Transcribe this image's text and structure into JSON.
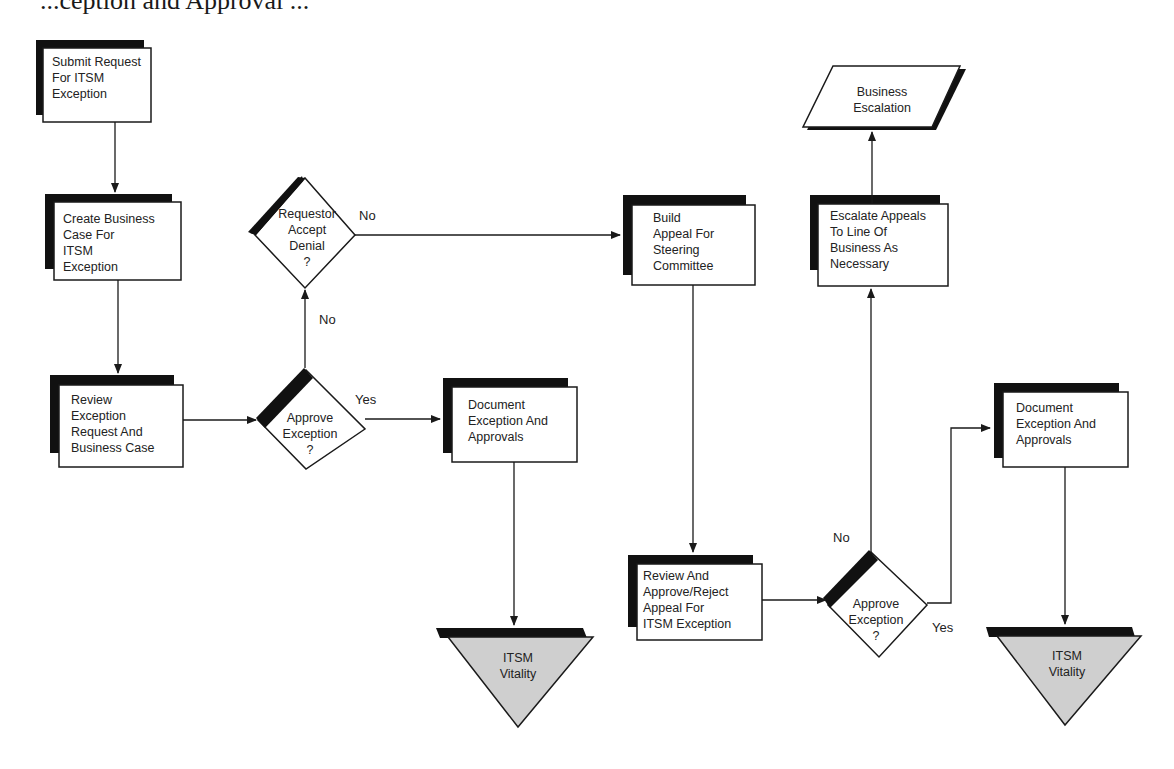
{
  "header": {
    "cut_text": "    ...ception and Approval ..."
  },
  "colors": {
    "stroke": "#1a1a1a",
    "shadow": "#111111",
    "box_fill": "#ffffff",
    "terminal_fill": "#cfcfcf"
  },
  "nodes": {
    "submit_request": {
      "type": "process",
      "lines": [
        "Submit Request",
        "For ITSM",
        "Exception"
      ]
    },
    "create_business_case": {
      "type": "process",
      "lines": [
        "Create Business",
        "Case For",
        "ITSM",
        "Exception"
      ]
    },
    "review_exception_request": {
      "type": "process",
      "lines": [
        "Review",
        "Exception",
        "Request And",
        "Business Case"
      ]
    },
    "approve_exception_1": {
      "type": "decision",
      "lines": [
        "Approve",
        "Exception",
        "?"
      ]
    },
    "requestor_accept_denial": {
      "type": "decision",
      "lines": [
        "Requestor",
        "Accept",
        "Denial",
        "?"
      ]
    },
    "document_exception_1": {
      "type": "process",
      "lines": [
        "Document",
        "Exception And",
        "Approvals"
      ]
    },
    "itsm_vitality_1": {
      "type": "terminal-triangle",
      "lines": [
        "ITSM",
        "Vitality"
      ]
    },
    "build_appeal": {
      "type": "process",
      "lines": [
        "Build",
        "Appeal For",
        "Steering",
        "Committee"
      ]
    },
    "review_approve_reject_appeal": {
      "type": "process",
      "lines": [
        "Review And",
        "Approve/Reject",
        "Appeal For",
        "ITSM Exception"
      ]
    },
    "approve_exception_2": {
      "type": "decision",
      "lines": [
        "Approve",
        "Exception",
        "?"
      ]
    },
    "escalate_appeals": {
      "type": "process",
      "lines": [
        "Escalate Appeals",
        "To Line Of",
        "Business As",
        "Necessary"
      ]
    },
    "business_escalation": {
      "type": "data-parallelogram",
      "lines": [
        "Business",
        "Escalation"
      ]
    },
    "document_exception_2": {
      "type": "process",
      "lines": [
        "Document",
        "Exception And",
        "Approvals"
      ]
    },
    "itsm_vitality_2": {
      "type": "terminal-triangle",
      "lines": [
        "ITSM",
        "Vitality"
      ]
    }
  },
  "edge_labels": {
    "approve1_yes": "Yes",
    "approve1_no": "No",
    "requestor_no": "No",
    "approve2_no": "No",
    "approve2_yes": "Yes"
  }
}
